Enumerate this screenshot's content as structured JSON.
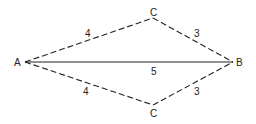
{
  "diagram": {
    "points": {
      "A": {
        "label": "A",
        "x": 25,
        "y": 62
      },
      "B": {
        "label": "B",
        "x": 233,
        "y": 62
      },
      "C_top": {
        "label": "C",
        "x": 153,
        "y": 18
      },
      "C_bottom": {
        "label": "C",
        "x": 153,
        "y": 105
      }
    },
    "edges": [
      {
        "from": "A",
        "to": "B",
        "style": "solid",
        "label": "5"
      },
      {
        "from": "A",
        "to": "C_top",
        "style": "dashed",
        "label": "4"
      },
      {
        "from": "C_top",
        "to": "B",
        "style": "dashed",
        "label": "3"
      },
      {
        "from": "A",
        "to": "C_bottom",
        "style": "dashed",
        "label": "4"
      },
      {
        "from": "C_bottom",
        "to": "B",
        "style": "dashed",
        "label": "3"
      }
    ],
    "stroke_color": "#222222"
  }
}
